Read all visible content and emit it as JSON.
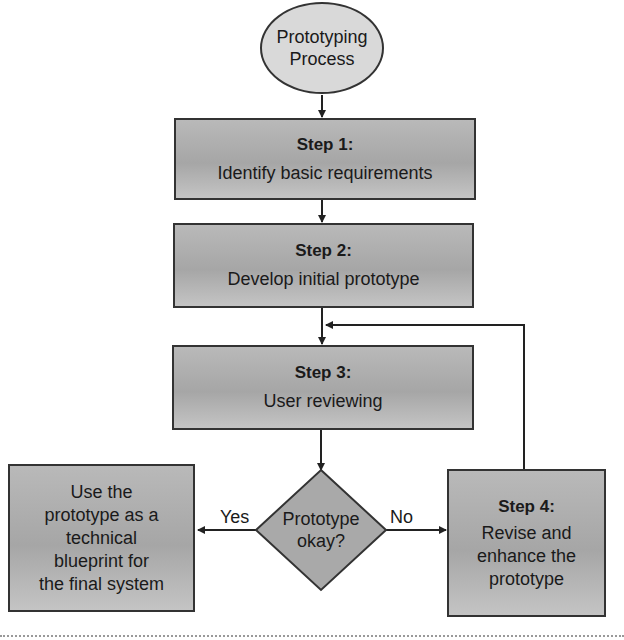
{
  "diagram": {
    "type": "flowchart",
    "start": {
      "label_line1": "Prototyping",
      "label_line2": "Process"
    },
    "steps": [
      {
        "title": "Step 1:",
        "text": "Identify basic requirements"
      },
      {
        "title": "Step 2:",
        "text": "Develop initial prototype"
      },
      {
        "title": "Step 3:",
        "text": "User reviewing"
      },
      {
        "title": "Step 4:",
        "text_lines": [
          "Revise and",
          "enhance the",
          "prototype"
        ]
      }
    ],
    "decision": {
      "line1": "Prototype",
      "line2": "okay?"
    },
    "outcome": {
      "text_lines": [
        "Use the",
        "prototype as a",
        "technical",
        "blueprint for",
        "the final system"
      ]
    },
    "edge_labels": {
      "yes": "Yes",
      "no": "No"
    },
    "colors": {
      "box_fill": "#b0b0b0",
      "ellipse_fill": "#d9d9d9",
      "stroke": "#333333"
    }
  }
}
